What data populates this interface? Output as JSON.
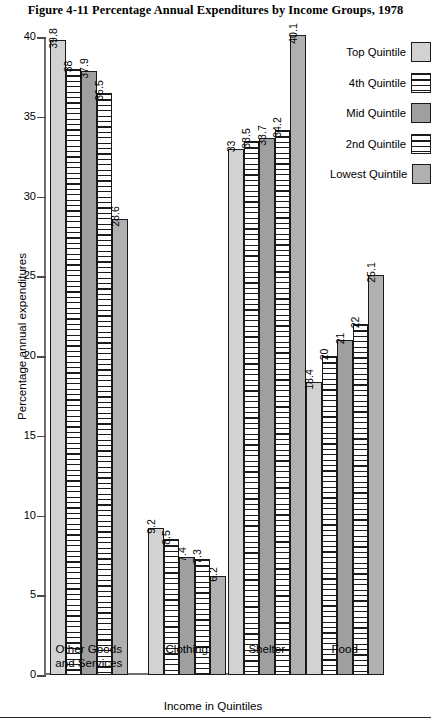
{
  "figure": {
    "title": "Figure 4-11   Percentage Annual Expenditures by Income Groups, 1978"
  },
  "legend": {
    "entries": [
      {
        "label": "Top Quintile",
        "pattern": "solid-light"
      },
      {
        "label": "4th Quintile",
        "pattern": "horizontal-stripes"
      },
      {
        "label": "Mid Quintile",
        "pattern": "solid-mid"
      },
      {
        "label": "2nd Quintile",
        "pattern": "horizontal-stripes"
      },
      {
        "label": "Lowest Quintile",
        "pattern": "solid-dark"
      }
    ]
  },
  "axes": {
    "y_title": "Percentage annual expenditures",
    "x_title": "Income in Quintiles",
    "y_ticks": [
      "0",
      "5",
      "10",
      "15",
      "20",
      "25",
      "30",
      "35",
      "40"
    ]
  },
  "chart_data": {
    "type": "bar",
    "title": "Figure 4-11   Percentage Annual Expenditures by Income Groups, 1978",
    "xlabel": "Income in Quintiles",
    "ylabel": "Percentage annual expenditures",
    "ylim": [
      0,
      40
    ],
    "ytick_step": 5,
    "grid": false,
    "legend_position": "right",
    "categories": [
      "Other Goods and Services",
      "Clothing",
      "Shelter",
      "Food"
    ],
    "series": [
      {
        "name": "Top Quintile",
        "values": [
          39.8,
          9.2,
          33.0,
          18.4
        ],
        "labels": [
          "39.8",
          "9.2",
          "33",
          "18.4"
        ]
      },
      {
        "name": "4th Quintile",
        "values": [
          38.0,
          8.5,
          33.5,
          20.0
        ],
        "labels": [
          "38",
          "8.5",
          "33.5",
          "20"
        ]
      },
      {
        "name": "Mid Quintile",
        "values": [
          37.9,
          7.4,
          33.7,
          21.0
        ],
        "labels": [
          "37.9",
          "7.4",
          "33.7",
          "21"
        ]
      },
      {
        "name": "2nd Quintile",
        "values": [
          36.5,
          7.3,
          34.2,
          22.0
        ],
        "labels": [
          "36.5",
          "7.3",
          "34.2",
          "22"
        ]
      },
      {
        "name": "Lowest Quintile",
        "values": [
          28.6,
          6.2,
          40.1,
          25.1
        ],
        "labels": [
          "28.6",
          "6.2",
          "40.1",
          "25.1"
        ]
      }
    ]
  },
  "cat_display": [
    "Other Goods\nand Services",
    "Clothing",
    "Shelter",
    "Food"
  ]
}
